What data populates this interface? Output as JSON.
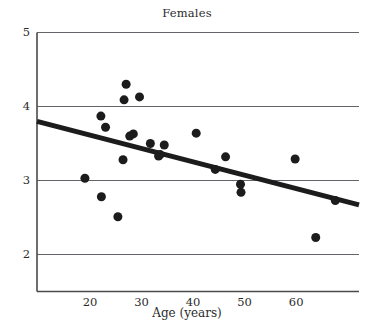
{
  "chart_data": {
    "type": "scatter",
    "title": "Females",
    "xlabel": "Age (years)",
    "ylabel": "",
    "xlim": [
      9.7,
      72.2
    ],
    "ylim": [
      1.5,
      5.0
    ],
    "xticks": [
      20,
      30,
      40,
      50,
      60
    ],
    "xticklabels": [
      "20",
      "30",
      "40",
      "50",
      "60"
    ],
    "yticks": [
      2,
      3,
      4,
      5
    ],
    "yticklabels": [
      "2",
      "3",
      "4",
      "5"
    ],
    "grid": "horizontal",
    "legend": "none",
    "marker": {
      "shape": "circle",
      "color": "#1c1c1c",
      "size_px": 9
    },
    "points": [
      {
        "x": 19.0,
        "y": 3.03
      },
      {
        "x": 22.1,
        "y": 3.87
      },
      {
        "x": 22.2,
        "y": 2.78
      },
      {
        "x": 23.0,
        "y": 3.72
      },
      {
        "x": 25.4,
        "y": 2.51
      },
      {
        "x": 26.4,
        "y": 3.28
      },
      {
        "x": 26.6,
        "y": 4.09
      },
      {
        "x": 27.0,
        "y": 4.3
      },
      {
        "x": 27.7,
        "y": 3.6
      },
      {
        "x": 28.4,
        "y": 3.63
      },
      {
        "x": 29.6,
        "y": 4.13
      },
      {
        "x": 31.7,
        "y": 3.5
      },
      {
        "x": 33.3,
        "y": 3.33
      },
      {
        "x": 33.6,
        "y": 3.35
      },
      {
        "x": 34.4,
        "y": 3.48
      },
      {
        "x": 40.6,
        "y": 3.64
      },
      {
        "x": 44.3,
        "y": 3.15
      },
      {
        "x": 46.3,
        "y": 3.32
      },
      {
        "x": 49.2,
        "y": 2.95
      },
      {
        "x": 49.3,
        "y": 2.84
      },
      {
        "x": 59.8,
        "y": 3.29
      },
      {
        "x": 63.8,
        "y": 2.23
      },
      {
        "x": 67.6,
        "y": 2.73
      }
    ],
    "trendline": {
      "type": "linear-fit",
      "color": "#1c1c1c",
      "width_px": 5,
      "x_start": 9.7,
      "y_start": 3.8,
      "x_end": 72.2,
      "y_end": 2.67
    }
  }
}
